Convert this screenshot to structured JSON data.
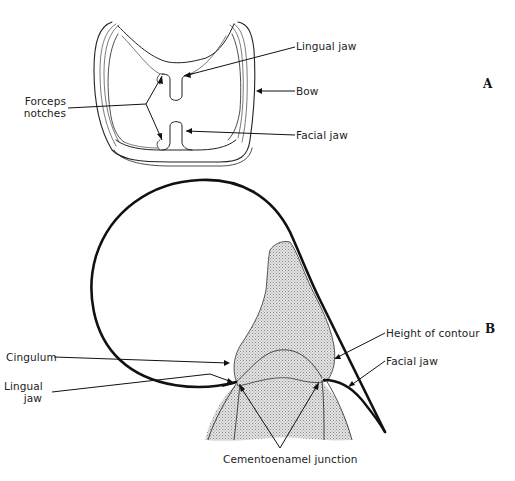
{
  "figure": {
    "panels": [
      {
        "id": "A",
        "letter": "A",
        "labels": {
          "lingual_jaw": "Lingual jaw",
          "bow": "Bow",
          "facial_jaw": "Facial jaw",
          "forceps_notches_line1": "Forceps",
          "forceps_notches_line2": "notches"
        }
      },
      {
        "id": "B",
        "letter": "B",
        "labels": {
          "cingulum": "Cingulum",
          "lingual_jaw_line1": "Lingual",
          "lingual_jaw_line2": "jaw",
          "height_of_contour": "Height of contour",
          "facial_jaw": "Facial jaw",
          "cementoenamel_junction": "Cementoenamel junction"
        }
      }
    ],
    "colors": {
      "line": "#111111",
      "tooth_fill": "#d4d4d4",
      "background": "#ffffff"
    }
  }
}
